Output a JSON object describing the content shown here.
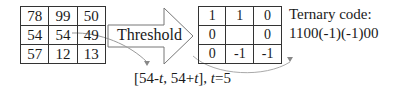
{
  "left_grid": {
    "rows": [
      [
        "78",
        "99",
        "50"
      ],
      [
        "54",
        "54",
        "49"
      ],
      [
        "57",
        "12",
        "13"
      ]
    ]
  },
  "threshold_arrow": {
    "label": "Threshold"
  },
  "right_grid": {
    "rows": [
      [
        "1",
        "1",
        "0"
      ],
      [
        "0",
        "",
        "0"
      ],
      [
        "0",
        "-1",
        "-1"
      ]
    ]
  },
  "ternary": {
    "title": "Ternary code:",
    "code": "1100(-1)(-1)00"
  },
  "range": {
    "prefix": "[54-",
    "t1": "t",
    "mid": ", 54+",
    "t2": "t",
    "suffix": "], ",
    "t3": "t",
    "eq": "=5"
  },
  "colors": {
    "line": "#333333",
    "curve": "#999999",
    "arrow_fill": "#ffffff"
  }
}
